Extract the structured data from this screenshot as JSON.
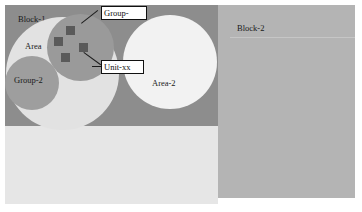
{
  "diagram": {
    "blocks": [
      {
        "id": "block-1",
        "label": "Block-1"
      },
      {
        "id": "block-2",
        "label": "Block-2"
      },
      {
        "id": "block-3",
        "label": "Block-3"
      }
    ],
    "areas": [
      {
        "id": "area-1",
        "label": "Area"
      },
      {
        "id": "area-2",
        "label": "Area-2"
      }
    ],
    "groups": [
      {
        "id": "group-1",
        "label": "Group-"
      },
      {
        "id": "group-2",
        "label": "Group-2"
      }
    ],
    "callouts": [
      {
        "id": "callout-group",
        "label": "Group-",
        "points_to": "group-1"
      },
      {
        "id": "callout-unit",
        "label": "Unit-xx",
        "points_to": "unit"
      }
    ],
    "units": [
      {
        "id": "unit-1",
        "left": 66,
        "top": 26
      },
      {
        "id": "unit-2",
        "left": 54,
        "top": 37
      },
      {
        "id": "unit-3",
        "left": 79,
        "top": 43
      },
      {
        "id": "unit-4",
        "left": 61,
        "top": 53
      }
    ],
    "colors": {
      "page_background": "#ffffff",
      "block_1_fill": "#8d8d8d",
      "block_2_fill": "#b4b4b4",
      "block_3_fill": "#e6e6e6",
      "area_1_fill": "#e2e2e2",
      "area_2_fill": "#f2f2f2",
      "group_1_fill": "#9a9a9a",
      "group_2_fill": "#9e9e9e",
      "unit_fill": "#5a5a5a",
      "callout_border": "#111111",
      "callout_fill": "#ffffff",
      "text": "#1a1a1a",
      "leader_line": "#1c1c1c",
      "block_2_rule": "#c6c6c6"
    }
  }
}
